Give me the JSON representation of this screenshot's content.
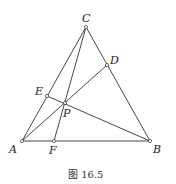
{
  "figure": {
    "caption": "图 16.5",
    "points": {
      "A": {
        "label": "A",
        "x": 22,
        "y": 141
      },
      "B": {
        "label": "B",
        "x": 150,
        "y": 141
      },
      "C": {
        "label": "C",
        "x": 86,
        "y": 27
      },
      "D": {
        "label": "D",
        "x": 107,
        "y": 65
      },
      "E": {
        "label": "E",
        "x": 47,
        "y": 96
      },
      "F": {
        "label": "F",
        "x": 54,
        "y": 141
      },
      "P": {
        "label": "P",
        "x": 65,
        "y": 103
      }
    },
    "segments": [
      [
        "A",
        "B"
      ],
      [
        "B",
        "C"
      ],
      [
        "C",
        "A"
      ],
      [
        "A",
        "D"
      ],
      [
        "B",
        "E"
      ],
      [
        "C",
        "F"
      ]
    ],
    "stroke_color": "#333333"
  }
}
